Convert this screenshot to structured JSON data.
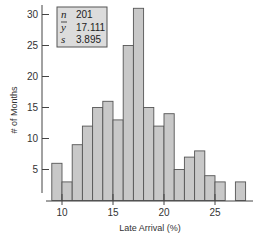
{
  "chart_data": {
    "type": "bar",
    "subtype": "histogram",
    "title": "",
    "xlabel": "Late Arrival (%)",
    "ylabel": "# of Months",
    "bin_width": 1,
    "bin_edges": [
      9,
      10,
      11,
      12,
      13,
      14,
      15,
      16,
      17,
      18,
      19,
      20,
      21,
      22,
      23,
      24,
      25,
      26,
      27,
      28
    ],
    "categories": [
      "9-10",
      "10-11",
      "11-12",
      "12-13",
      "13-14",
      "14-15",
      "15-16",
      "16-17",
      "17-18",
      "18-19",
      "19-20",
      "20-21",
      "21-22",
      "22-23",
      "23-24",
      "24-25",
      "25-26",
      "26-27",
      "27-28"
    ],
    "values": [
      6,
      3,
      9,
      12,
      15,
      16,
      13,
      25,
      31,
      15,
      12,
      14,
      5,
      7,
      8,
      4,
      3,
      0,
      3
    ],
    "x_ticks": [
      10,
      15,
      20,
      25
    ],
    "y_ticks": [
      5,
      10,
      15,
      20,
      25,
      30
    ],
    "xlim": [
      8.5,
      28.5
    ],
    "ylim": [
      0,
      31.5
    ],
    "grid": false,
    "bar_fill": "#c8c8c8",
    "bar_stroke": "#555555",
    "stats_box": {
      "position": "top-left",
      "rows": [
        {
          "symbol": "n",
          "value": "201"
        },
        {
          "symbol": "ȳ",
          "value": "17.111"
        },
        {
          "symbol": "s",
          "value": "3.895"
        }
      ]
    }
  },
  "labels": {
    "xlabel": "Late Arrival (%)",
    "ylabel": "# of Months"
  },
  "stats": {
    "n_symbol": "n",
    "n_value": "201",
    "mean_symbol": "y",
    "mean_value": "17.111",
    "sd_symbol": "s",
    "sd_value": "3.895"
  }
}
